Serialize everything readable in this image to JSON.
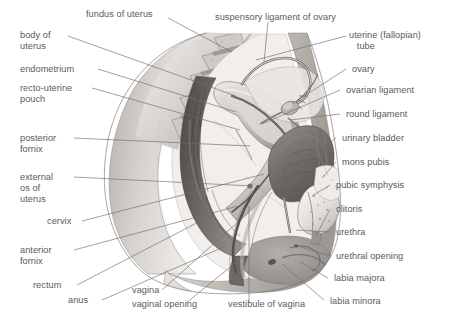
{
  "figure": {
    "kind": "anatomical-illustration",
    "background_color": "#ffffff",
    "label_color": "#5a5a5a",
    "leader_line_color": "#6e6e6e",
    "illustration_palette": {
      "lightest": "#f4f3f1",
      "light": "#dedad6",
      "mid": "#b3aeaa",
      "dark": "#7d7874",
      "darkest": "#3d3a38"
    }
  },
  "labels": {
    "fundus_of_uterus": "fundus of uterus",
    "suspensory_ligament_of_ovary": "suspensory ligament of ovary",
    "body_of_uterus": "body of\nuterus",
    "uterine_fallopian_tube": "uterine (fallopian)\n   tube",
    "endometrium": "endometrium",
    "ovary": "ovary",
    "recto_uterine_pouch": "recto-uterine\npouch",
    "ovarian_ligament": "ovarian ligament",
    "round_ligament": "round ligament",
    "posterior_fornix": "posterior\nfornix",
    "urinary_bladder": "urinary bladder",
    "mons_pubis": "mons pubis",
    "external_os_of_uterus": "external\nos of\nuterus",
    "pubic_symphysis": "pubic symphysis",
    "clitoris": "clitoris",
    "cervix": "cervix",
    "urethra": "urethra",
    "anterior_fornix": "anterior\nfornix",
    "urethral_opening": "urethral opening",
    "rectum": "rectum",
    "labia_majora": "labia majora",
    "anus": "anus",
    "vagina": "vagina",
    "labia_minora": "labia minora",
    "vaginal_opening": "vaginal opening",
    "vestibule_of_vagina": "vestibule of vagina"
  }
}
